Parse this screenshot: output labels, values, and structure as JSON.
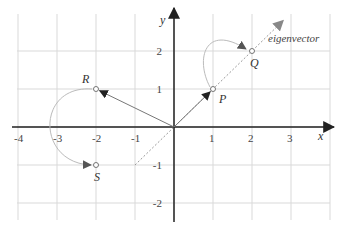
{
  "diagram": {
    "type": "coordinate-plane",
    "axes": {
      "x_label": "x",
      "y_label": "y",
      "x_range": [
        -4,
        4
      ],
      "y_range": [
        -2,
        2
      ],
      "x_ticks": [
        "-4",
        "-3",
        "-2",
        "-1",
        "1",
        "2",
        "3"
      ],
      "x_tick_values": [
        -4,
        -3,
        -2,
        -1,
        1,
        2,
        3
      ],
      "y_ticks": [
        "2",
        "1",
        "-1",
        "-2"
      ],
      "y_tick_values": [
        2,
        1,
        -1,
        -2
      ]
    },
    "points": [
      {
        "id": "P",
        "label": "P",
        "x": 1,
        "y": 1
      },
      {
        "id": "Q",
        "label": "Q",
        "x": 2,
        "y": 2
      },
      {
        "id": "R",
        "label": "R",
        "x": -2,
        "y": 1
      },
      {
        "id": "S",
        "label": "S",
        "x": -2,
        "y": -1
      }
    ],
    "vectors": [
      {
        "from": [
          0,
          0
        ],
        "to": [
          1,
          1
        ],
        "name": "vector-to-P"
      },
      {
        "from": [
          0,
          0
        ],
        "to": [
          -2,
          1
        ],
        "name": "vector-to-R"
      }
    ],
    "transforms": [
      {
        "from": "P",
        "to": "Q"
      },
      {
        "from": "R",
        "to": "S"
      }
    ],
    "eigenvector": {
      "label": "eigenvector",
      "from": [
        -1,
        -1
      ],
      "to": [
        2.8,
        2.8
      ]
    },
    "colors": {
      "axis": "#222222",
      "grid": "#d9d9d9",
      "vector": "#777777",
      "curve": "#bbbbbb",
      "eigen": "#999999"
    }
  }
}
